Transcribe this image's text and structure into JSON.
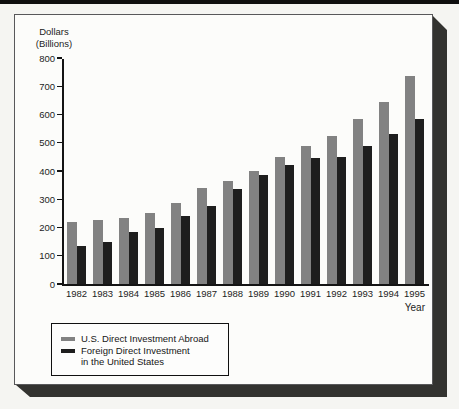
{
  "chart_data": {
    "type": "bar",
    "title": "",
    "ylabel": "Dollars (Billions)",
    "ylabel_lines": [
      "Dollars",
      "(Billions)"
    ],
    "xlabel": "Year",
    "categories": [
      "1982",
      "1983",
      "1984",
      "1985",
      "1986",
      "1987",
      "1988",
      "1989",
      "1990",
      "1991",
      "1992",
      "1993",
      "1994",
      "1995"
    ],
    "series": [
      {
        "name": "U.S. Direct Investment Abroad",
        "color": "#828282",
        "values": [
          220,
          225,
          235,
          250,
          285,
          340,
          365,
          400,
          450,
          490,
          525,
          585,
          645,
          735
        ]
      },
      {
        "name": "Foreign Direct Investment in the United States",
        "color": "#1e1e1e",
        "values": [
          135,
          150,
          185,
          200,
          240,
          275,
          335,
          385,
          420,
          445,
          450,
          490,
          530,
          585
        ]
      }
    ],
    "ylim": [
      0,
      800
    ],
    "y_ticks": [
      800,
      700,
      600,
      500,
      400,
      300,
      200,
      100,
      0
    ],
    "grid": false,
    "legend_position": "bottom-left"
  },
  "legend": {
    "items": [
      {
        "color": "#828282",
        "lines": [
          "U.S. Direct Investment Abroad"
        ]
      },
      {
        "color": "#1e1e1e",
        "lines": [
          "Foreign Direct Investment",
          "in the United States"
        ]
      }
    ]
  },
  "colors": {
    "panel_background": "#fcfcfa",
    "page_background": "#f5f5f2",
    "shadow": "#333330",
    "axis": "#141414",
    "top_rule": "#0e0e0e"
  }
}
